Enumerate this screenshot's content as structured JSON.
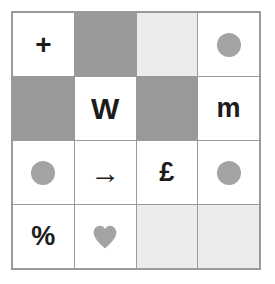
{
  "panel": {
    "name": "symbol-grid",
    "rows": 4,
    "columns": 4,
    "border_color": "#9a9a9a",
    "background": "#ffffff"
  },
  "colors": {
    "cell_white": "#ffffff",
    "cell_gray": "#999999",
    "cell_light_gray": "#ececec",
    "shape_gray": "#a3a3a3",
    "glyph_dark": "#1c1c1c",
    "grid_line": "#9a9a9a"
  },
  "cells": [
    {
      "row": 1,
      "col": 1,
      "fill": "white",
      "content_type": "glyph",
      "glyph": "+",
      "name": "cell-r1c1-plus"
    },
    {
      "row": 1,
      "col": 2,
      "fill": "gray",
      "content_type": "none",
      "glyph": "",
      "name": "cell-r1c2-gray-block"
    },
    {
      "row": 1,
      "col": 3,
      "fill": "lightgray",
      "content_type": "none",
      "glyph": "",
      "name": "cell-r1c3-lightgray-block"
    },
    {
      "row": 1,
      "col": 4,
      "fill": "white",
      "content_type": "circle",
      "glyph": "",
      "name": "cell-r1c4-circle"
    },
    {
      "row": 2,
      "col": 1,
      "fill": "gray",
      "content_type": "none",
      "glyph": "",
      "name": "cell-r2c1-gray-block"
    },
    {
      "row": 2,
      "col": 2,
      "fill": "white",
      "content_type": "glyph",
      "glyph": "W",
      "name": "cell-r2c2-letter-w"
    },
    {
      "row": 2,
      "col": 3,
      "fill": "gray",
      "content_type": "none",
      "glyph": "",
      "name": "cell-r2c3-gray-block"
    },
    {
      "row": 2,
      "col": 4,
      "fill": "white",
      "content_type": "glyph",
      "glyph": "m",
      "name": "cell-r2c4-letter-m"
    },
    {
      "row": 3,
      "col": 1,
      "fill": "white",
      "content_type": "circle",
      "glyph": "",
      "name": "cell-r3c1-circle"
    },
    {
      "row": 3,
      "col": 2,
      "fill": "white",
      "content_type": "glyph",
      "glyph": "→",
      "name": "cell-r3c2-arrow"
    },
    {
      "row": 3,
      "col": 3,
      "fill": "white",
      "content_type": "glyph",
      "glyph": "£",
      "name": "cell-r3c3-pound"
    },
    {
      "row": 3,
      "col": 4,
      "fill": "white",
      "content_type": "circle",
      "glyph": "",
      "name": "cell-r3c4-circle"
    },
    {
      "row": 4,
      "col": 1,
      "fill": "white",
      "content_type": "glyph",
      "glyph": "%",
      "name": "cell-r4c1-percent"
    },
    {
      "row": 4,
      "col": 2,
      "fill": "white",
      "content_type": "heart",
      "glyph": "",
      "name": "cell-r4c2-heart"
    },
    {
      "row": 4,
      "col": 3,
      "fill": "lightgray",
      "content_type": "none",
      "glyph": "",
      "name": "cell-r4c3-lightgray-block"
    },
    {
      "row": 4,
      "col": 4,
      "fill": "lightgray",
      "content_type": "none",
      "glyph": "",
      "name": "cell-r4c4-lightgray-block"
    }
  ]
}
